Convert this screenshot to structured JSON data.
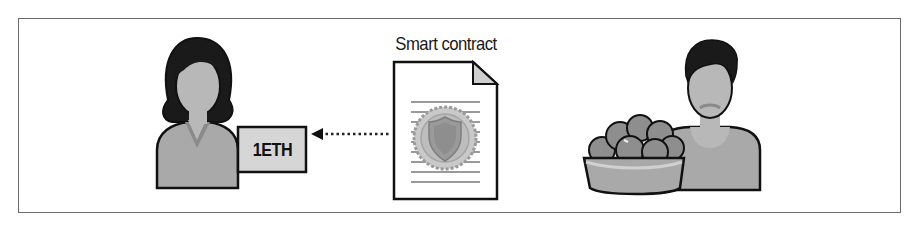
{
  "diagram": {
    "title": "Smart contract",
    "payment": {
      "amount_label": "1ETH",
      "direction": "from smart contract to buyer"
    },
    "nodes": [
      {
        "id": "buyer",
        "icon": "woman-avatar-icon"
      },
      {
        "id": "contract",
        "icon": "document-with-seal-icon",
        "label": "Smart contract"
      },
      {
        "id": "seller",
        "icon": "man-with-fruit-basket-icon"
      }
    ],
    "edges": [
      {
        "from": "contract",
        "to": "buyer",
        "style": "dotted-arrow",
        "label": "1ETH"
      }
    ],
    "colors": {
      "border": "#6a6a6a",
      "outline": "#111111",
      "skin": "#b8b8b8",
      "hair": "#1a1a1a",
      "body_fill": "#a9a9a9",
      "box_fill": "#d6d6d6",
      "seal": "#9a9a9a"
    }
  }
}
